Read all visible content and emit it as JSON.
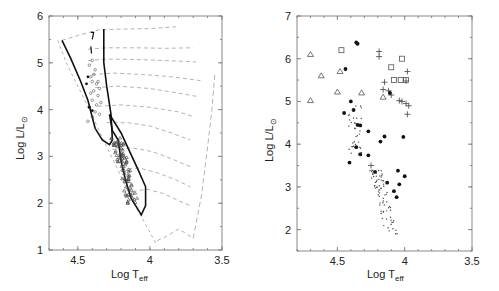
{
  "chart_data": [
    {
      "type": "scatter",
      "panel": "left",
      "title": "",
      "xlabel": "Log T_eff",
      "ylabel": "Log L/L_sun",
      "xlim": [
        4.7,
        3.5
      ],
      "ylim": [
        1,
        6
      ],
      "x_inverted": true,
      "xticks": [
        4.5,
        4,
        3.5
      ],
      "xtick_labels": [
        "4.5",
        "4",
        "3.5"
      ],
      "yticks": [
        1,
        2,
        3,
        4,
        5,
        6
      ],
      "ytick_labels": [
        "1",
        "2",
        "3",
        "4",
        "5",
        "6"
      ],
      "grid": false,
      "tracks_dashed": [
        [
          [
            4.61,
            5.48
          ],
          [
            4.48,
            5.6
          ],
          [
            4.36,
            5.7
          ],
          [
            4.2,
            5.72
          ],
          [
            4.0,
            5.73
          ],
          [
            3.82,
            5.77
          ]
        ],
        [
          [
            4.43,
            5.29
          ],
          [
            4.3,
            5.32
          ],
          [
            4.1,
            5.32
          ],
          [
            3.9,
            5.31
          ],
          [
            3.7,
            5.32
          ]
        ],
        [
          [
            4.43,
            5.05
          ],
          [
            4.3,
            5.08
          ],
          [
            4.1,
            5.07
          ],
          [
            3.9,
            5.05
          ],
          [
            3.68,
            5.02
          ]
        ],
        [
          [
            4.4,
            4.75
          ],
          [
            4.25,
            4.78
          ],
          [
            4.05,
            4.75
          ],
          [
            3.85,
            4.7
          ],
          [
            3.65,
            4.62
          ]
        ],
        [
          [
            4.38,
            4.47
          ],
          [
            4.22,
            4.5
          ],
          [
            4.0,
            4.45
          ],
          [
            3.8,
            4.35
          ],
          [
            3.67,
            4.28
          ]
        ],
        [
          [
            4.36,
            4.07
          ],
          [
            4.2,
            4.1
          ],
          [
            4.0,
            4.05
          ],
          [
            3.8,
            3.95
          ],
          [
            3.7,
            3.85
          ]
        ],
        [
          [
            4.3,
            3.72
          ],
          [
            4.15,
            3.72
          ],
          [
            4.0,
            3.65
          ],
          [
            3.85,
            3.5
          ],
          [
            3.72,
            3.35
          ]
        ],
        [
          [
            4.26,
            3.15
          ],
          [
            4.12,
            3.18
          ],
          [
            3.98,
            3.1
          ],
          [
            3.85,
            2.95
          ],
          [
            3.72,
            2.78
          ]
        ],
        [
          [
            4.2,
            2.73
          ],
          [
            4.07,
            2.75
          ],
          [
            3.95,
            2.65
          ],
          [
            3.82,
            2.5
          ],
          [
            3.72,
            2.35
          ]
        ],
        [
          [
            4.12,
            2.25
          ],
          [
            4.02,
            2.3
          ],
          [
            3.9,
            2.2
          ],
          [
            3.8,
            2.05
          ],
          [
            3.72,
            1.95
          ]
        ],
        [
          [
            3.95,
            1.2
          ],
          [
            3.88,
            1.3
          ],
          [
            3.8,
            1.45
          ],
          [
            3.75,
            1.35
          ],
          [
            3.7,
            1.25
          ]
        ]
      ],
      "zams_dotted": [
        [
          4.64,
          5.48
        ],
        [
          4.58,
          5.0
        ],
        [
          4.5,
          4.5
        ],
        [
          4.42,
          4.0
        ],
        [
          4.33,
          3.4
        ],
        [
          4.22,
          2.7
        ],
        [
          4.13,
          2.1
        ],
        [
          4.03,
          1.55
        ],
        [
          3.96,
          1.15
        ]
      ],
      "rgb_dashed": [
        [
          3.7,
          1.25
        ],
        [
          3.64,
          2.2
        ],
        [
          3.6,
          3.2
        ],
        [
          3.57,
          4.0
        ],
        [
          3.55,
          4.75
        ]
      ],
      "boundary_upper": [
        [
          4.61,
          5.48
        ],
        [
          4.55,
          5.1
        ],
        [
          4.48,
          4.6
        ],
        [
          4.43,
          4.2
        ],
        [
          4.38,
          3.6
        ],
        [
          4.33,
          3.35
        ],
        [
          4.28,
          3.25
        ],
        [
          4.26,
          3.35
        ],
        [
          4.27,
          3.9
        ],
        [
          4.3,
          4.5
        ],
        [
          4.32,
          5.0
        ],
        [
          4.32,
          5.72
        ]
      ],
      "boundary_lower": [
        [
          4.28,
          3.9
        ],
        [
          4.26,
          3.55
        ],
        [
          4.22,
          3.35
        ],
        [
          4.2,
          2.9
        ],
        [
          4.17,
          2.5
        ],
        [
          4.13,
          2.1
        ],
        [
          4.06,
          1.75
        ],
        [
          4.03,
          1.95
        ],
        [
          4.03,
          2.35
        ],
        [
          4.08,
          2.7
        ],
        [
          4.14,
          3.1
        ],
        [
          4.2,
          3.5
        ],
        [
          4.25,
          3.75
        ],
        [
          4.28,
          3.9
        ]
      ],
      "points_open_circles": [
        [
          4.4,
          5.05
        ],
        [
          4.42,
          4.95
        ],
        [
          4.38,
          4.85
        ],
        [
          4.41,
          4.7
        ],
        [
          4.37,
          4.55
        ],
        [
          4.39,
          4.4
        ],
        [
          4.36,
          4.3
        ],
        [
          4.4,
          4.2
        ],
        [
          4.37,
          4.1
        ],
        [
          4.42,
          4.05
        ],
        [
          4.38,
          3.95
        ],
        [
          4.35,
          3.9
        ],
        [
          4.4,
          3.85
        ],
        [
          4.43,
          3.75
        ],
        [
          4.36,
          4.6
        ],
        [
          4.4,
          4.6
        ],
        [
          4.34,
          4.15
        ],
        [
          4.35,
          4.45
        ],
        [
          4.39,
          4.75
        ],
        [
          4.41,
          4.35
        ]
      ],
      "points_filled": [
        [
          4.43,
          4.7
        ],
        [
          4.44,
          4.55
        ],
        [
          4.42,
          4.05
        ],
        [
          4.4,
          3.98
        ]
      ],
      "points_triangles_cluster": {
        "x_range": [
          4.1,
          4.26
        ],
        "y_range": [
          2.0,
          3.4
        ],
        "count": 90
      }
    },
    {
      "type": "scatter",
      "panel": "right",
      "title": "",
      "xlabel": "Log T_eff",
      "ylabel": "Log L/L_sun",
      "xlim": [
        4.8,
        3.5
      ],
      "ylim": [
        1.5,
        7
      ],
      "x_inverted": true,
      "xticks": [
        4.5,
        4,
        3.5
      ],
      "xtick_labels": [
        "4.5",
        "4",
        "3.5"
      ],
      "yticks": [
        2,
        3,
        4,
        5,
        6,
        7
      ],
      "ytick_labels": [
        "2",
        "3",
        "4",
        "5",
        "6",
        "7"
      ],
      "grid": false,
      "series": [
        {
          "name": "open-triangles",
          "marker": "triangle-open",
          "points": [
            [
              4.7,
              6.1
            ],
            [
              4.62,
              5.6
            ],
            [
              4.7,
              5.02
            ],
            [
              4.5,
              5.22
            ],
            [
              4.32,
              5.2
            ],
            [
              4.16,
              5.1
            ],
            [
              4.48,
              5.7
            ]
          ]
        },
        {
          "name": "open-squares",
          "marker": "square-open",
          "points": [
            [
              4.47,
              6.2
            ],
            [
              4.02,
              6.0
            ],
            [
              4.1,
              5.8
            ],
            [
              4.08,
              5.5
            ],
            [
              4.03,
              5.5
            ],
            [
              3.99,
              5.5
            ]
          ]
        },
        {
          "name": "plus",
          "marker": "plus",
          "points": [
            [
              4.19,
              6.17
            ],
            [
              4.19,
              6.05
            ],
            [
              4.15,
              5.45
            ],
            [
              4.16,
              5.28
            ],
            [
              4.12,
              5.25
            ],
            [
              4.1,
              5.15
            ],
            [
              3.98,
              5.7
            ],
            [
              3.99,
              5.48
            ],
            [
              4.04,
              5.02
            ],
            [
              4.02,
              5.0
            ],
            [
              3.99,
              4.95
            ],
            [
              3.97,
              4.9
            ],
            [
              3.98,
              4.7
            ],
            [
              4.25,
              3.5
            ]
          ]
        },
        {
          "name": "filled-circles",
          "marker": "circle-filled",
          "points": [
            [
              4.36,
              6.38
            ],
            [
              4.35,
              6.35
            ],
            [
              4.44,
              5.76
            ],
            [
              4.11,
              5.2
            ],
            [
              4.4,
              5.0
            ],
            [
              4.38,
              4.8
            ],
            [
              4.45,
              4.73
            ],
            [
              4.35,
              4.45
            ],
            [
              4.33,
              4.44
            ],
            [
              4.27,
              4.3
            ],
            [
              4.15,
              4.18
            ],
            [
              4.01,
              4.17
            ],
            [
              4.18,
              4.06
            ],
            [
              4.36,
              3.93
            ],
            [
              4.33,
              3.76
            ],
            [
              4.27,
              3.74
            ],
            [
              4.41,
              3.57
            ],
            [
              4.22,
              3.35
            ],
            [
              4.05,
              3.38
            ],
            [
              4.0,
              3.25
            ],
            [
              4.13,
              3.1
            ],
            [
              4.04,
              3.06
            ],
            [
              4.08,
              2.9
            ],
            [
              4.06,
              2.76
            ]
          ]
        },
        {
          "name": "small-dots",
          "marker": "dot",
          "cluster": {
            "x_range": [
              4.08,
              4.45
            ],
            "y_range": [
              1.9,
              4.9
            ],
            "count": 110
          }
        }
      ]
    }
  ],
  "labels": {
    "left": {
      "xlabel_main": "Log T",
      "xlabel_sub": "eff",
      "ylabel_main": "Log L/L",
      "ylabel_sub": "⊙"
    },
    "right": {
      "xlabel_main": "Log T",
      "xlabel_sub": "eff",
      "ylabel_main": "Log L/L",
      "ylabel_sub": "⊙"
    }
  },
  "colors": {
    "axis": "#888888",
    "text": "#222222",
    "boundary": "#111111",
    "tracks": "#aaaaaa",
    "markers": "#111111",
    "open_markers": "#555555"
  }
}
